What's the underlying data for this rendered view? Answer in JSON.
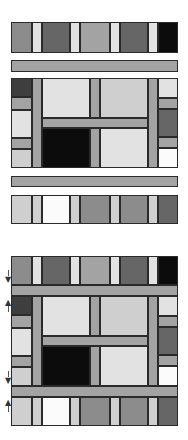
{
  "palette": {
    "black": "#0c0c0c",
    "darkest": "#3e3e3e",
    "dark": "#666666",
    "mid": "#8c8c8c",
    "sash": "#a3a3a3",
    "light": "#cfcfcf",
    "pale": "#e2e2e2",
    "white": "#fbfbfb"
  },
  "columns_x": [
    11,
    32,
    42,
    70,
    80,
    90,
    100,
    110,
    120,
    148,
    158,
    178
  ],
  "upper_panel": {
    "top_strip": {
      "y": 22,
      "h": 31,
      "cells": [
        {
          "x": 11,
          "w": 21,
          "c": "mid"
        },
        {
          "x": 32,
          "w": 10,
          "c": "pale"
        },
        {
          "x": 42,
          "w": 28,
          "c": "dark"
        },
        {
          "x": 70,
          "w": 10,
          "c": "pale"
        },
        {
          "x": 80,
          "w": 30,
          "c": "sash"
        },
        {
          "x": 110,
          "w": 10,
          "c": "pale"
        },
        {
          "x": 120,
          "w": 28,
          "c": "dark"
        },
        {
          "x": 148,
          "w": 10,
          "c": "pale"
        },
        {
          "x": 158,
          "w": 20,
          "c": "black"
        }
      ]
    },
    "sash_top": {
      "y": 60,
      "h": 12
    },
    "center_block": {
      "y": 78,
      "h": 90
    },
    "sash_bottom": {
      "y": 176,
      "h": 11
    },
    "bottom_strip": {
      "y": 195,
      "h": 29,
      "cells": [
        {
          "x": 11,
          "w": 21,
          "c": "light"
        },
        {
          "x": 32,
          "w": 10,
          "c": "light"
        },
        {
          "x": 42,
          "w": 28,
          "c": "white"
        },
        {
          "x": 70,
          "w": 10,
          "c": "light"
        },
        {
          "x": 80,
          "w": 30,
          "c": "mid"
        },
        {
          "x": 110,
          "w": 10,
          "c": "light"
        },
        {
          "x": 120,
          "w": 28,
          "c": "mid"
        },
        {
          "x": 148,
          "w": 10,
          "c": "light"
        },
        {
          "x": 158,
          "w": 20,
          "c": "dark"
        }
      ]
    }
  },
  "lower_panel": {
    "top_strip": {
      "y": 256,
      "h": 29
    },
    "sash_top": {
      "y": 285,
      "h": 11
    },
    "center_block": {
      "y": 296,
      "h": 90
    },
    "sash_bottom": {
      "y": 386,
      "h": 11
    },
    "bottom_strip": {
      "y": 397,
      "h": 29
    }
  },
  "center_layout": {
    "left_column": [
      {
        "dy": 0,
        "h": 19,
        "c": "darkest"
      },
      {
        "dy": 19,
        "h": 13,
        "c": "sash"
      },
      {
        "dy": 32,
        "h": 28,
        "c": "pale"
      },
      {
        "dy": 60,
        "h": 11,
        "c": "sash"
      },
      {
        "dy": 71,
        "h": 19,
        "c": "light"
      }
    ],
    "right_column": [
      {
        "dy": 0,
        "h": 20,
        "c": "pale"
      },
      {
        "dy": 20,
        "h": 11,
        "c": "sash"
      },
      {
        "dy": 31,
        "h": 28,
        "c": "dark"
      },
      {
        "dy": 59,
        "h": 11,
        "c": "sash"
      },
      {
        "dy": 70,
        "h": 20,
        "c": "white"
      }
    ],
    "blocks": [
      {
        "x": 32,
        "dy": 0,
        "w": 10,
        "h": 90,
        "c": "sash"
      },
      {
        "x": 42,
        "dy": 0,
        "w": 48,
        "h": 40,
        "c": "pale"
      },
      {
        "x": 90,
        "dy": 0,
        "w": 10,
        "h": 40,
        "c": "sash"
      },
      {
        "x": 100,
        "dy": 0,
        "w": 48,
        "h": 40,
        "c": "light"
      },
      {
        "x": 42,
        "dy": 40,
        "w": 106,
        "h": 10,
        "c": "sash"
      },
      {
        "x": 42,
        "dy": 50,
        "w": 48,
        "h": 40,
        "c": "black"
      },
      {
        "x": 90,
        "dy": 50,
        "w": 10,
        "h": 40,
        "c": "sash"
      },
      {
        "x": 100,
        "dy": 50,
        "w": 48,
        "h": 40,
        "c": "pale"
      },
      {
        "x": 148,
        "dy": 0,
        "w": 10,
        "h": 90,
        "c": "sash"
      }
    ]
  },
  "arrows": [
    {
      "x": 5,
      "y": 276,
      "glyph": "▼"
    },
    {
      "x": 5,
      "y": 299,
      "glyph": "▲"
    },
    {
      "x": 5,
      "y": 377,
      "glyph": "▼"
    },
    {
      "x": 5,
      "y": 399,
      "glyph": "▲"
    }
  ]
}
